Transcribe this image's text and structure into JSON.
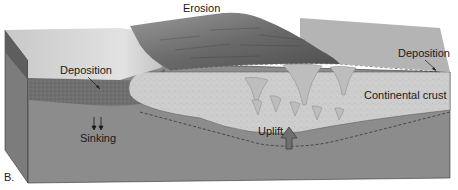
{
  "figure": {
    "panel_label": "B.",
    "labels": {
      "erosion": "Erosion",
      "deposition_left": "Deposition",
      "deposition_right": "Deposition",
      "continental_crust": "Continental crust",
      "sinking": "Sinking",
      "uplift": "Uplift"
    },
    "colors": {
      "mantle": "#8a8a8a",
      "mantle_side": "#7a7a7a",
      "crust": "#cfcfcf",
      "sediment": "#6e6e6e",
      "surface_light": "#d9d9d9",
      "mountain_dark": "#5a5a5a",
      "uplift_arrow": "#707070"
    }
  }
}
